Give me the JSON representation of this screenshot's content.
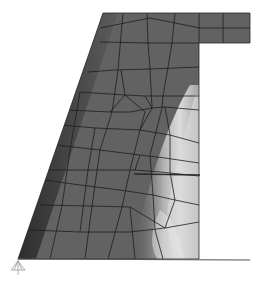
{
  "figure": {
    "type": "finite-element stress contour (grayscale)",
    "colors": {
      "background": "#ffffff",
      "body_dark": "#5a5a5a",
      "body_mid": "#6e6e6e",
      "edge_dark": "#3a3a3a",
      "light_zone": "#d8d8d8",
      "mesh_line": "#1e1e1e",
      "support": "#9a9a9a"
    },
    "annotations": {
      "interior_line": "horizontal marker line",
      "support_symbol": "pinned support icon"
    }
  }
}
